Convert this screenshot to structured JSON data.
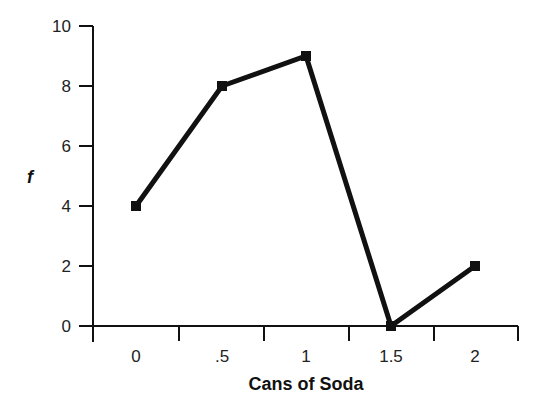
{
  "chart_data": {
    "type": "line",
    "title": "",
    "xlabel": "Cans of Soda",
    "ylabel": "f",
    "categories": [
      "0",
      ".5",
      "1",
      "1.5",
      "2"
    ],
    "x": [
      0,
      0.5,
      1,
      1.5,
      2
    ],
    "values": [
      4,
      8,
      9,
      0,
      2
    ],
    "yticks": [
      "0",
      "2",
      "4",
      "6",
      "8",
      "10"
    ],
    "ylim": [
      0,
      10
    ],
    "grid": false,
    "legend": null,
    "marker": "square",
    "line_color": "#111111"
  }
}
